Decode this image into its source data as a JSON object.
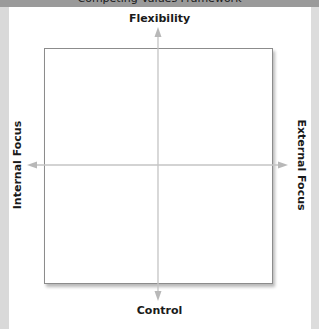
{
  "diagram": {
    "title": "Competing Values Framework",
    "axes": {
      "vertical": {
        "top_label": "Flexibility",
        "bottom_label": "Control"
      },
      "horizontal": {
        "left_label": "Internal Focus",
        "right_label": "External Focus"
      }
    },
    "colors": {
      "header_bar": "#9a9a9a",
      "axis_line": "#c0c0c0",
      "box_border": "#8c8c8c",
      "side_strip": "#d9d9d9",
      "text": "#1a1a1a"
    }
  }
}
